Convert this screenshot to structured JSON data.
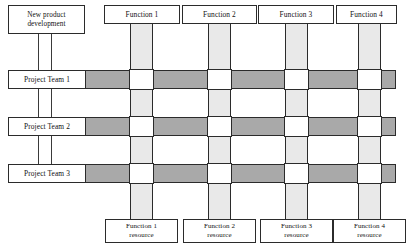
{
  "diagram": {
    "type": "matrix-organization-structure",
    "root": {
      "label": "New product\ndevelopment",
      "line1": "New product",
      "line2": "development"
    },
    "project_teams": [
      {
        "id": "team-1",
        "label": "Project Team 1"
      },
      {
        "id": "team-2",
        "label": "Project Team 2"
      },
      {
        "id": "team-3",
        "label": "Project Team 3"
      }
    ],
    "functions": [
      {
        "id": "function-1",
        "label": "Function 1"
      },
      {
        "id": "function-2",
        "label": "Function 2"
      },
      {
        "id": "function-3",
        "label": "Function 3"
      },
      {
        "id": "function-4",
        "label": "Function 4"
      }
    ],
    "function_resources": [
      {
        "id": "function-1-resource",
        "line1": "Function 1",
        "line2": "resource"
      },
      {
        "id": "function-2-resource",
        "line1": "Function 2",
        "line2": "resource"
      },
      {
        "id": "function-3-resource",
        "line1": "Function 3",
        "line2": "resource"
      },
      {
        "id": "function-4-resource",
        "line1": "Function 4",
        "line2": "resource"
      }
    ],
    "colors": {
      "project_bar": "#a9a9a9",
      "function_column": "#e9e9e9",
      "intersection": "#ffffff",
      "outline": "#2b2b2b",
      "background": "#ffffff",
      "text": "#111111"
    }
  }
}
